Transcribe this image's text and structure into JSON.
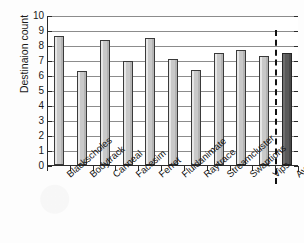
{
  "chart_data": {
    "type": "bar",
    "title": "",
    "xlabel": "",
    "ylabel": "Destinaion count",
    "ylim": [
      0,
      10
    ],
    "yticks": [
      10,
      9,
      8,
      7,
      6,
      5,
      4,
      3,
      2,
      1,
      0
    ],
    "grid": true,
    "legend": "none",
    "categories": [
      "Blackscholes",
      "Bodytrack",
      "Canneal",
      "Facesim",
      "Ferret",
      "Fluidanimate",
      "Raytrace",
      "Streamcluster",
      "Swaptions",
      "Vips",
      "Average"
    ],
    "values": [
      8.6,
      6.3,
      8.35,
      6.95,
      8.45,
      7.1,
      6.35,
      7.45,
      7.7,
      7.3,
      7.45
    ],
    "bar_colors": [
      "#c9c9c9",
      "#c9c9c9",
      "#c9c9c9",
      "#c9c9c9",
      "#c9c9c9",
      "#c9c9c9",
      "#c9c9c9",
      "#c9c9c9",
      "#c9c9c9",
      "#c9c9c9",
      "#5a5a5a"
    ],
    "annotations": [
      {
        "type": "vertical-dashed-separator",
        "before_category": "Average",
        "color": "#111111"
      }
    ]
  },
  "colors": {
    "bar_fill": "#c9c9c9",
    "bar_edge": "#3a3a3a",
    "average_fill": "#5a5a5a",
    "gridline": "#8c8c8c",
    "axis": "#2b2b2b",
    "text": "#141414",
    "background": "#fdfdfd"
  }
}
